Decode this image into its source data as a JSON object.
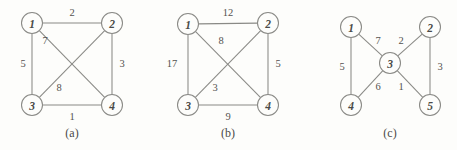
{
  "figure": {
    "background_color": "#fdfdfb",
    "stroke_color": "#8a8a86",
    "text_color": "#4a4a48",
    "node_radius": 10.5
  },
  "chart_data": {
    "type": "diagram",
    "title": "",
    "subtitle": "",
    "graphs": [
      {
        "caption": "(a)",
        "caption_pos": {
          "x": 72,
          "y": 133
        },
        "nodes": [
          {
            "label": "1",
            "x": 32,
            "y": 23
          },
          {
            "label": "2",
            "x": 112,
            "y": 23
          },
          {
            "label": "3",
            "x": 32,
            "y": 105
          },
          {
            "label": "4",
            "x": 112,
            "y": 105
          }
        ],
        "edges": [
          {
            "from": 0,
            "to": 1,
            "weight": "2",
            "lx": 72,
            "ly": 12
          },
          {
            "from": 0,
            "to": 2,
            "weight": "5",
            "lx": 23,
            "ly": 63
          },
          {
            "from": 0,
            "to": 3,
            "weight": "7",
            "lx": 45,
            "ly": 40
          },
          {
            "from": 1,
            "to": 2,
            "weight": "8",
            "lx": 59,
            "ly": 87
          },
          {
            "from": 1,
            "to": 3,
            "weight": "3",
            "lx": 122,
            "ly": 63
          },
          {
            "from": 2,
            "to": 3,
            "weight": "1",
            "lx": 72,
            "ly": 116
          }
        ]
      },
      {
        "caption": "(b)",
        "caption_pos": {
          "x": 228,
          "y": 133
        },
        "nodes": [
          {
            "label": "1",
            "x": 188,
            "y": 24
          },
          {
            "label": "2",
            "x": 268,
            "y": 23
          },
          {
            "label": "3",
            "x": 188,
            "y": 105
          },
          {
            "label": "4",
            "x": 268,
            "y": 105
          }
        ],
        "edges": [
          {
            "from": 0,
            "to": 1,
            "weight": "12",
            "lx": 228,
            "ly": 12
          },
          {
            "from": 0,
            "to": 2,
            "weight": "17",
            "lx": 172,
            "ly": 63
          },
          {
            "from": 0,
            "to": 3,
            "weight": "8",
            "lx": 221,
            "ly": 40
          },
          {
            "from": 1,
            "to": 2,
            "weight": "3",
            "lx": 215,
            "ly": 87
          },
          {
            "from": 1,
            "to": 3,
            "weight": "5",
            "lx": 278,
            "ly": 63
          },
          {
            "from": 2,
            "to": 3,
            "weight": "9",
            "lx": 228,
            "ly": 116
          }
        ]
      },
      {
        "caption": "(c)",
        "caption_pos": {
          "x": 390,
          "y": 133
        },
        "nodes": [
          {
            "label": "1",
            "x": 351,
            "y": 27
          },
          {
            "label": "2",
            "x": 430,
            "y": 27
          },
          {
            "label": "3",
            "x": 390,
            "y": 63
          },
          {
            "label": "4",
            "x": 351,
            "y": 105
          },
          {
            "label": "5",
            "x": 430,
            "y": 105
          }
        ],
        "edges": [
          {
            "from": 0,
            "to": 2,
            "weight": "7",
            "lx": 378,
            "ly": 40
          },
          {
            "from": 1,
            "to": 2,
            "weight": "2",
            "lx": 401,
            "ly": 40
          },
          {
            "from": 2,
            "to": 3,
            "weight": "6",
            "lx": 378,
            "ly": 86
          },
          {
            "from": 2,
            "to": 4,
            "weight": "1",
            "lx": 401,
            "ly": 86
          },
          {
            "from": 0,
            "to": 3,
            "weight": "5",
            "lx": 342,
            "ly": 66
          },
          {
            "from": 1,
            "to": 4,
            "weight": "3",
            "lx": 440,
            "ly": 66
          }
        ]
      }
    ]
  }
}
